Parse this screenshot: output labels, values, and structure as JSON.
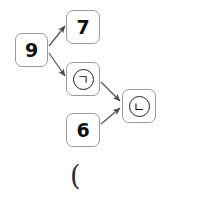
{
  "diagram": {
    "background_color": "#ffffff",
    "node_border_color": "#9a9a9a",
    "edge_color": "#555555",
    "text_color": "#111111",
    "nodes": [
      {
        "id": "n9",
        "label": "9",
        "kind": "number",
        "x": 15,
        "y": 33,
        "w": 33,
        "h": 34
      },
      {
        "id": "n7",
        "label": "7",
        "kind": "number",
        "x": 66,
        "y": 10,
        "w": 34,
        "h": 34
      },
      {
        "id": "ng",
        "label": "ㄱ",
        "kind": "circled-letter",
        "x": 66,
        "y": 62,
        "w": 34,
        "h": 34
      },
      {
        "id": "n6",
        "label": "6",
        "kind": "number",
        "x": 66,
        "y": 113,
        "w": 34,
        "h": 34
      },
      {
        "id": "nn",
        "label": "ㄴ",
        "kind": "circled-letter",
        "x": 122,
        "y": 89,
        "w": 34,
        "h": 34
      }
    ],
    "edges": [
      {
        "id": "e1",
        "from": "n9",
        "to": "n7",
        "x1": 49,
        "y1": 46,
        "x2": 65,
        "y2": 26
      },
      {
        "id": "e2",
        "from": "n9",
        "to": "ng",
        "x1": 49,
        "y1": 53,
        "x2": 65,
        "y2": 76
      },
      {
        "id": "e3",
        "from": "ng",
        "to": "nn",
        "x1": 101,
        "y1": 82,
        "x2": 120,
        "y2": 101
      },
      {
        "id": "e4",
        "from": "n6",
        "to": "nn",
        "x1": 101,
        "y1": 124,
        "x2": 120,
        "y2": 108
      }
    ],
    "annotation": {
      "text": "(",
      "x": 70,
      "y": 162
    }
  }
}
